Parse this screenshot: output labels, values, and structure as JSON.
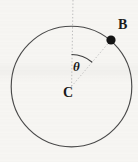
{
  "figure": {
    "type": "geometry-diagram",
    "background_color": "#f7f6f3",
    "stroke_color": "#3a3a3a",
    "guide_color": "#b9b9b9"
  },
  "labels": {
    "point_b": "B",
    "center_c": "C",
    "angle_theta": "θ"
  },
  "geometry": {
    "circle": {
      "center_x": 71.5,
      "center_y": 86.5,
      "radius": 60.5
    },
    "point_b": {
      "x": 111,
      "y": 40,
      "dot_radius": 4.5
    },
    "reference_line": {
      "from_x": 73,
      "from_y": 0,
      "to_x": 71.5,
      "to_y": 86.5,
      "style": "dotted"
    },
    "radius_line": {
      "from_x": 71.5,
      "from_y": 86.5,
      "to_x": 111,
      "to_y": 40,
      "style": "dotted"
    },
    "angle_arc": {
      "radius": 32,
      "start_angle_deg": 90,
      "end_angle_deg": 49.7,
      "label": "θ"
    }
  }
}
